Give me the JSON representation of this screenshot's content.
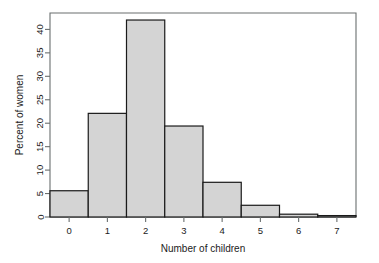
{
  "chart_data": {
    "type": "bar",
    "title": "",
    "xlabel": "Number of children",
    "ylabel": "Percent of women",
    "categories": [
      "0",
      "1",
      "2",
      "3",
      "4",
      "5",
      "6",
      "7"
    ],
    "values": [
      5.6,
      22.1,
      42.0,
      19.4,
      7.4,
      2.5,
      0.6,
      0.3
    ],
    "x_tick_labels": [
      "0",
      "1",
      "2",
      "3",
      "4",
      "5",
      "6",
      "7"
    ],
    "y_tick_labels": [
      "0",
      "5",
      "10",
      "15",
      "20",
      "25",
      "30",
      "35",
      "40"
    ],
    "y_tick_values": [
      0,
      5,
      10,
      15,
      20,
      25,
      30,
      35,
      40
    ],
    "xlim": [
      -0.5,
      7.5
    ],
    "ylim": [
      0,
      43.5
    ],
    "grid": false,
    "legend": "none",
    "bar_fill_color": "#d4d4d4",
    "bar_edge_color": "#1a1a1a",
    "frame_color": "#6a6f6f",
    "background_color": "#ffffff"
  }
}
